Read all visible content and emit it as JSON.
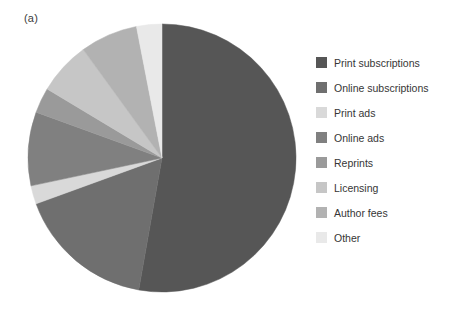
{
  "panel": {
    "label": "(a)"
  },
  "legend": {
    "position": "right"
  },
  "chart_data": {
    "type": "pie",
    "title": "(a)",
    "subtitle": "",
    "xlabel": "",
    "ylabel": "",
    "start_angle_deg": 0,
    "direction": "clockwise",
    "center": {
      "x": 136,
      "y": 134
    },
    "radius": 132,
    "grid": false,
    "legend_position": "right",
    "units": "percent",
    "categories": [
      "Print subscriptions",
      "Online subscriptions",
      "Print ads",
      "Online ads",
      "Reprints",
      "Licensing",
      "Author fees",
      "Other"
    ],
    "values": [
      52.8,
      16.7,
      2.2,
      8.9,
      3.1,
      6.4,
      6.9,
      3.0
    ],
    "angles_deg": [
      190.0,
      60.0,
      8.0,
      32.0,
      11.0,
      23.0,
      25.0,
      11.0
    ],
    "colors": [
      "#565656",
      "#6f6f6f",
      "#d9d9d9",
      "#808080",
      "#9a9a9a",
      "#c6c6c6",
      "#b2b2b2",
      "#e9e9e9"
    ],
    "slices": [
      {
        "label": "Print subscriptions",
        "value": 52.8,
        "angle_deg": 190.0,
        "color": "#565656"
      },
      {
        "label": "Online subscriptions",
        "value": 16.7,
        "angle_deg": 60.0,
        "color": "#6f6f6f"
      },
      {
        "label": "Print ads",
        "value": 2.2,
        "angle_deg": 8.0,
        "color": "#d9d9d9"
      },
      {
        "label": "Online ads",
        "value": 8.9,
        "angle_deg": 32.0,
        "color": "#808080"
      },
      {
        "label": "Reprints",
        "value": 3.1,
        "angle_deg": 11.0,
        "color": "#9a9a9a"
      },
      {
        "label": "Licensing",
        "value": 6.4,
        "angle_deg": 23.0,
        "color": "#c6c6c6"
      },
      {
        "label": "Author fees",
        "value": 6.9,
        "angle_deg": 25.0,
        "color": "#b2b2b2"
      },
      {
        "label": "Other",
        "value": 3.0,
        "angle_deg": 11.0,
        "color": "#e9e9e9"
      }
    ]
  }
}
